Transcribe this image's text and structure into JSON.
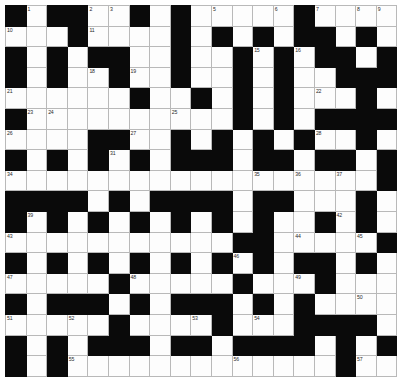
{
  "puzzle": {
    "title": "Crossword Grid",
    "rows": 18,
    "cols": 19,
    "cell_size_px": 21,
    "colors": {
      "block": "#0a0a0a",
      "cell": "#fdfdfd",
      "grid_line": "#b9b9b9",
      "number_text": "#2a2a2a",
      "background": "#ffffff"
    },
    "max_clue_number": 57,
    "grid": [
      "#.##..#.#.....#....",
      "...#....#.#.#.##.#.",
      "#.#.##..#..#.#.##.#",
      "#.#..#..#..#.#..###",
      "......#..#.#.#...#.",
      "#..........#.#.####",
      "....##..#.#.#.#..#.",
      "#.#.#.#.###.##.##.#",
      "..................#",
      "####.#.####.##...#.",
      "#.#.#.#.#.#.#..#.#.",
      "...........##.....#",
      "#.#.#.#.#.#.#.##.#.",
      ".....#.....#...#...",
      "#.###.#.###.#.#....",
      ".....#....#...####.",
      "#.#.###.##.####.#.#",
      "#.#.............#.."
    ],
    "numbered_cells": [
      {
        "n": 1,
        "r": 0,
        "c": 1
      },
      {
        "n": 2,
        "r": 0,
        "c": 4
      },
      {
        "n": 3,
        "r": 0,
        "c": 5
      },
      {
        "n": 4,
        "r": 0,
        "c": 8
      },
      {
        "n": 5,
        "r": 0,
        "c": 10
      },
      {
        "n": 6,
        "r": 0,
        "c": 13
      },
      {
        "n": 7,
        "r": 0,
        "c": 15
      },
      {
        "n": 8,
        "r": 0,
        "c": 17
      },
      {
        "n": 9,
        "r": 0,
        "c": 18
      },
      {
        "n": 10,
        "r": 1,
        "c": 0
      },
      {
        "n": 11,
        "r": 1,
        "c": 4
      },
      {
        "n": 12,
        "r": 1,
        "c": 8
      },
      {
        "n": 13,
        "r": 1,
        "c": 10
      },
      {
        "n": 14,
        "r": 2,
        "c": 8
      },
      {
        "n": 15,
        "r": 2,
        "c": 12
      },
      {
        "n": 16,
        "r": 2,
        "c": 14
      },
      {
        "n": 17,
        "r": 2,
        "c": 16
      },
      {
        "n": 18,
        "r": 3,
        "c": 4
      },
      {
        "n": 19,
        "r": 3,
        "c": 6
      },
      {
        "n": 20,
        "r": 3,
        "c": 18
      },
      {
        "n": 21,
        "r": 4,
        "c": 0
      },
      {
        "n": 22,
        "r": 4,
        "c": 15
      },
      {
        "n": 23,
        "r": 5,
        "c": 1
      },
      {
        "n": 24,
        "r": 5,
        "c": 2
      },
      {
        "n": 25,
        "r": 5,
        "c": 8
      },
      {
        "n": 26,
        "r": 6,
        "c": 0
      },
      {
        "n": 27,
        "r": 6,
        "c": 6
      },
      {
        "n": 28,
        "r": 6,
        "c": 15
      },
      {
        "n": 29,
        "r": 6,
        "c": 17
      },
      {
        "n": 30,
        "r": 7,
        "c": 4
      },
      {
        "n": 31,
        "r": 7,
        "c": 5
      },
      {
        "n": 32,
        "r": 7,
        "c": 12
      },
      {
        "n": 33,
        "r": 7,
        "c": 18
      },
      {
        "n": 34,
        "r": 8,
        "c": 0
      },
      {
        "n": 35,
        "r": 8,
        "c": 12
      },
      {
        "n": 36,
        "r": 8,
        "c": 14
      },
      {
        "n": 37,
        "r": 8,
        "c": 16
      },
      {
        "n": 38,
        "r": 9,
        "c": 10
      },
      {
        "n": 39,
        "r": 10,
        "c": 1
      },
      {
        "n": 40,
        "r": 10,
        "c": 8
      },
      {
        "n": 41,
        "r": 10,
        "c": 10
      },
      {
        "n": 42,
        "r": 10,
        "c": 16
      },
      {
        "n": 43,
        "r": 11,
        "c": 0
      },
      {
        "n": 44,
        "r": 11,
        "c": 14
      },
      {
        "n": 45,
        "r": 11,
        "c": 17
      },
      {
        "n": 46,
        "r": 12,
        "c": 11
      },
      {
        "n": 47,
        "r": 13,
        "c": 0
      },
      {
        "n": 48,
        "r": 13,
        "c": 6
      },
      {
        "n": 49,
        "r": 13,
        "c": 14
      },
      {
        "n": 50,
        "r": 14,
        "c": 17
      },
      {
        "n": 51,
        "r": 15,
        "c": 0
      },
      {
        "n": 52,
        "r": 15,
        "c": 3
      },
      {
        "n": 53,
        "r": 15,
        "c": 9
      },
      {
        "n": 54,
        "r": 15,
        "c": 12
      },
      {
        "n": 55,
        "r": 17,
        "c": 3
      },
      {
        "n": 56,
        "r": 17,
        "c": 11
      },
      {
        "n": 57,
        "r": 17,
        "c": 17
      }
    ]
  }
}
